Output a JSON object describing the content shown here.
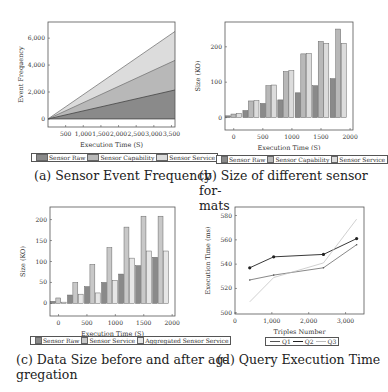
{
  "colors": {
    "raw": "#8a8a8a",
    "capability": "#b8b8b8",
    "service": "#dcdcdc",
    "aggregated": "#e6e6e6",
    "q1": "#555555",
    "q2": "#222222",
    "q3": "#bbbbbb"
  },
  "captions": {
    "a": "(a) Sensor Event Frequency",
    "b_line1": "(b) Size of different sensor for-",
    "b_line2": "mats",
    "c_line1": "(c) Data Size before and after ag-",
    "c_line2": "gregation",
    "d": "(d) Query Execution Time"
  },
  "legends": {
    "a": [
      "Sensor Raw",
      "Sensor Capability",
      "Sensor Service"
    ],
    "b": [
      "Sensor Raw",
      "Sensor Capability",
      "Sensor Service"
    ],
    "c": [
      "Sensor Raw",
      "Sensor Service",
      "Aggregated Sensor Service"
    ],
    "d": [
      "Q1",
      "Q2",
      "Q3"
    ]
  },
  "chart_data": [
    {
      "id": "a",
      "type": "area",
      "title": "Sensor Event Frequency",
      "xlabel": "Execution Time (S)",
      "ylabel": "Event Frequency",
      "x": [
        0,
        3600
      ],
      "xticks": [
        500,
        1000,
        1500,
        2000,
        2500,
        3000,
        3500
      ],
      "xtick_labels": [
        "500",
        "1,000",
        "1,500",
        "2,000",
        "2,500",
        "3,000",
        "3,500"
      ],
      "yticks": [
        0,
        2000,
        4000,
        6000
      ],
      "ytick_labels": [
        "0",
        "2,000",
        "4,000",
        "6,000"
      ],
      "xlim": [
        0,
        3600
      ],
      "ylim": [
        -600,
        7200
      ],
      "series": [
        {
          "name": "Sensor Raw",
          "values": [
            0,
            2150
          ]
        },
        {
          "name": "Sensor Capability",
          "values": [
            0,
            4350
          ]
        },
        {
          "name": "Sensor Service",
          "values": [
            0,
            6500
          ]
        }
      ],
      "legend_position": "below"
    },
    {
      "id": "b",
      "type": "bar",
      "title": "Size of different sensor formats",
      "xlabel": "Execution Time (S)",
      "ylabel": "Size (KO)",
      "categories": [
        0,
        300,
        600,
        900,
        1200,
        1500,
        1800
      ],
      "xticks": [
        0,
        500,
        1000,
        1500,
        2000
      ],
      "yticks": [
        0,
        100,
        200
      ],
      "xlim": [
        -150,
        2050
      ],
      "ylim": [
        -35,
        270
      ],
      "series": [
        {
          "name": "Sensor Raw",
          "values": [
            5,
            20,
            40,
            50,
            70,
            90,
            110
          ]
        },
        {
          "name": "Sensor Capability",
          "values": [
            10,
            47,
            90,
            130,
            180,
            215,
            250
          ]
        },
        {
          "name": "Sensor Service",
          "values": [
            12,
            48,
            92,
            133,
            181,
            210,
            210
          ]
        }
      ],
      "legend_position": "below"
    },
    {
      "id": "c",
      "type": "bar",
      "title": "Data Size before and after aggregation",
      "xlabel": "Execution Time (S)",
      "ylabel": "Size (KO)",
      "categories": [
        0,
        300,
        600,
        900,
        1200,
        1500,
        1800
      ],
      "xticks": [
        0,
        500,
        1000,
        1500,
        2000
      ],
      "yticks": [
        0,
        50,
        100,
        150,
        200
      ],
      "xlim": [
        -150,
        2050
      ],
      "ylim": [
        -30,
        230
      ],
      "series": [
        {
          "name": "Sensor Raw",
          "values": [
            5,
            20,
            40,
            50,
            70,
            90,
            110
          ]
        },
        {
          "name": "Sensor Service",
          "values": [
            13,
            50,
            93,
            133,
            182,
            208,
            208
          ]
        },
        {
          "name": "Aggregated Sensor Service",
          "values": [
            3,
            22,
            25,
            55,
            108,
            125,
            125
          ]
        }
      ],
      "legend_position": "below"
    },
    {
      "id": "d",
      "type": "line",
      "title": "Query Execution Time",
      "xlabel": "Triples Number",
      "ylabel": "Execution Time (ms)",
      "xticks": [
        0,
        1000,
        2000,
        3000
      ],
      "xtick_labels": [
        "0",
        "1,000",
        "2,000",
        "3,000"
      ],
      "yticks": [
        500,
        520,
        540,
        560,
        580
      ],
      "xlim": [
        0,
        3500
      ],
      "ylim": [
        499,
        587
      ],
      "x": [
        400,
        1050,
        2400,
        3300
      ],
      "series": [
        {
          "name": "Q1",
          "values": [
            527,
            531,
            537,
            556
          ]
        },
        {
          "name": "Q2",
          "values": [
            537,
            546,
            548,
            561
          ]
        },
        {
          "name": "Q3",
          "values": [
            509,
            529,
            541,
            577
          ]
        }
      ],
      "legend_position": "below"
    }
  ]
}
